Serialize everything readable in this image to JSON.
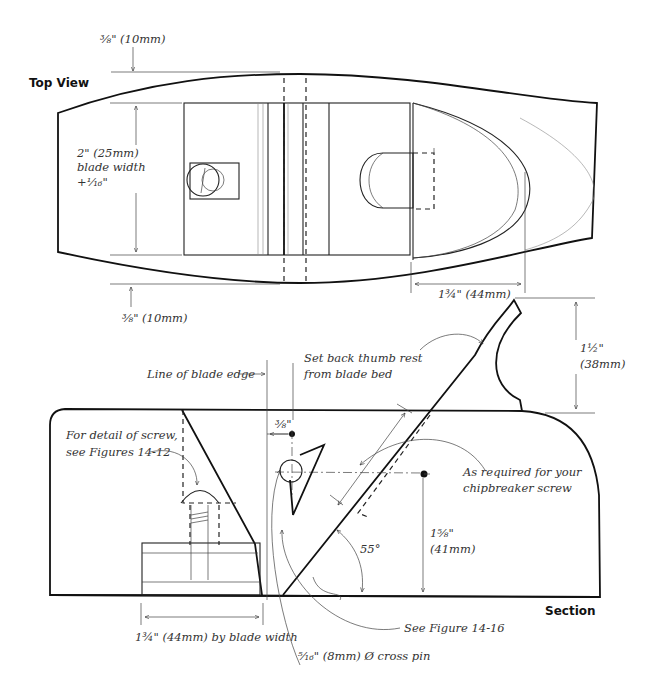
{
  "figure": {
    "views": {
      "top_view": {
        "title": "Top View"
      },
      "section_view": {
        "title": "Section"
      }
    },
    "top_view_annotations": {
      "top_margin": "⅜\" (10mm)",
      "bottom_margin": "⅜\" (10mm)",
      "blade_width_line1": "2\" (25mm)",
      "blade_width_line2": "blade width",
      "blade_width_line3": "+¹⁄₁₆\"",
      "front_length": "1¾\" (44mm)"
    },
    "section_annotations": {
      "line_of_blade_edge": "Line of blade edge",
      "thumb_rest_line1": "Set back thumb rest",
      "thumb_rest_line2": "from blade bed",
      "thumb_height_line1": "1½\"",
      "thumb_height_line2": "(38mm)",
      "screw_detail_line1": "For detail of screw,",
      "screw_detail_line2": "see Figures 14-12",
      "pin_offset": "⅜\"",
      "chipbreaker_line1": "As required for your",
      "chipbreaker_line2": "chipbreaker screw",
      "pin_height_line1": "1⅝\"",
      "pin_height_line2": "(41mm)",
      "bed_angle": "55°",
      "wedge_length": "1¾\" (44mm) by blade width",
      "see_figure": "See Figure 14-16",
      "cross_pin": "⁵⁄₁₆\" (8mm) Ø cross pin"
    },
    "colors": {
      "ink": "#111111",
      "text": "#333333",
      "background": "#ffffff"
    }
  }
}
